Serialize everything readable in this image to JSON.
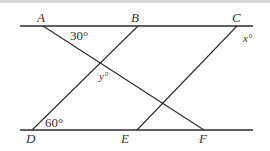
{
  "diagram": {
    "points": {
      "A": {
        "label": "A",
        "x": 43,
        "y": 26
      },
      "B": {
        "label": "B",
        "x": 138,
        "y": 26
      },
      "C": {
        "label": "C",
        "x": 237,
        "y": 26
      },
      "D": {
        "label": "D",
        "x": 32,
        "y": 130
      },
      "E": {
        "label": "E",
        "x": 137,
        "y": 130
      },
      "F": {
        "label": "F",
        "x": 204,
        "y": 130
      }
    },
    "angles": {
      "angle_A": "30°",
      "angle_D": "60°",
      "angle_x": "x°",
      "angle_y": "y°"
    },
    "colors": {
      "line": "#2b2b2b",
      "text": "#333333",
      "background": "#ffffff"
    }
  }
}
